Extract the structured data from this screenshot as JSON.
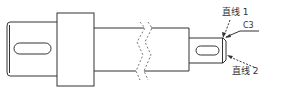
{
  "diagram": {
    "type": "mechanical-shaft-drawing",
    "colors": {
      "line": "#333333",
      "dashed": "#777777",
      "background": "#ffffff"
    },
    "labels": {
      "line1": "直线 1",
      "chamfer": "C3",
      "line2": "直线 2"
    },
    "parts": [
      {
        "name": "left-journal",
        "has_keyway": true,
        "has_chamfer": true
      },
      {
        "name": "shoulder-collar"
      },
      {
        "name": "middle-shaft",
        "break": "wavy-dashed"
      },
      {
        "name": "right-journal",
        "has_keyway": true,
        "chamfer": "C3"
      }
    ]
  }
}
